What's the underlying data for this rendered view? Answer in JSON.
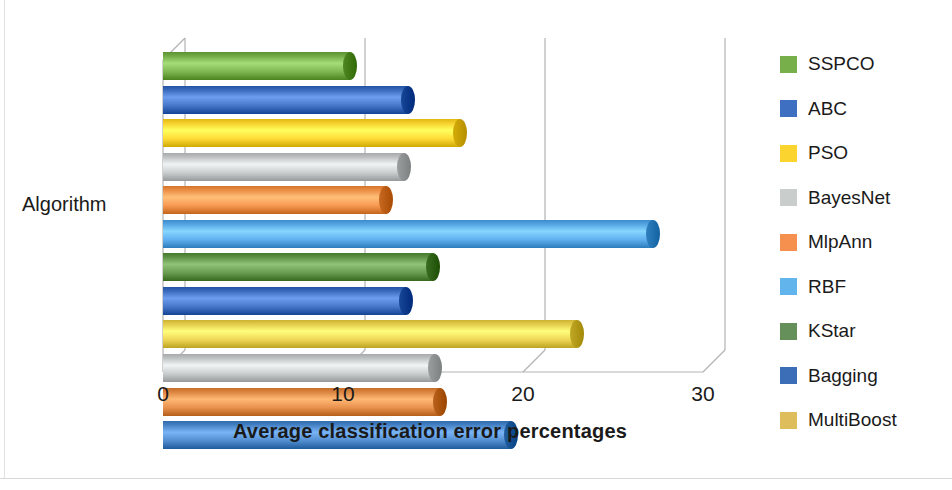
{
  "chart_data": {
    "type": "bar",
    "orientation": "horizontal",
    "title": "",
    "xlabel": "Average classification error percentages",
    "ylabel": "Algorithm",
    "xlim": [
      0,
      30
    ],
    "xticks": [
      0,
      10,
      20,
      30
    ],
    "xtick_labels": [
      "0",
      "10",
      "20",
      "30"
    ],
    "ytick_labels": [
      "Algorithm"
    ],
    "grid": true,
    "legend_position": "right",
    "style": "3d-cylinder",
    "categories": [
      "SSPCO",
      "ABC",
      "PSO",
      "BayesNet",
      "MlpAnn",
      "RBF",
      "KStar",
      "Bagging",
      "MultiBoost"
    ],
    "values": [
      10.8,
      14.0,
      16.9,
      13.8,
      12.8,
      27.6,
      15.4,
      13.9,
      23.4
    ],
    "series": [
      {
        "name": "Average classification error percentages",
        "points": [
          {
            "label": "SSPCO",
            "value": 10.8,
            "color": "#77b04a"
          },
          {
            "label": "ABC",
            "value": 14.0,
            "color": "#3f6fc0"
          },
          {
            "label": "PSO",
            "value": 16.9,
            "color": "#fcd430"
          },
          {
            "label": "BayesNet",
            "value": 13.8,
            "color": "#c3c6c7"
          },
          {
            "label": "MlpAnn",
            "value": 12.8,
            "color": "#f0914a"
          },
          {
            "label": "RBF",
            "value": 27.6,
            "color": "#58a8e8"
          },
          {
            "label": "KStar",
            "value": 15.4,
            "color": "#62954a"
          },
          {
            "label": "Bagging",
            "value": 13.9,
            "color": "#3f6fc0"
          },
          {
            "label": "MultiBoost",
            "value": 23.4,
            "color": "#e8cf4e"
          }
        ]
      }
    ],
    "extra_rows_below": [
      {
        "label": "BayesNet",
        "value": 15.5,
        "color": "#c3c6c7"
      },
      {
        "label": "MlpAnn",
        "value": 15.8,
        "color": "#e08a46"
      },
      {
        "label": "Bagging",
        "value": 19.7,
        "color": "#4a86c8"
      }
    ]
  },
  "axis": {
    "x_title": "Average classification error percentages",
    "y_title": "Algorithm",
    "tick_0": "0",
    "tick_1": "10",
    "tick_2": "20",
    "tick_3": "30"
  },
  "legend": {
    "items": [
      {
        "label": "SSPCO",
        "color": "#77b04a"
      },
      {
        "label": "ABC",
        "color": "#3f6fc0"
      },
      {
        "label": "PSO",
        "color": "#fcd430"
      },
      {
        "label": "BayesNet",
        "color": "#c9cdcb"
      },
      {
        "label": "MlpAnn",
        "color": "#f5904f"
      },
      {
        "label": "RBF",
        "color": "#62b4ec"
      },
      {
        "label": "KStar",
        "color": "#66905a"
      },
      {
        "label": "Bagging",
        "color": "#3c6eb8"
      },
      {
        "label": "MultiBoost",
        "color": "#ddbd5c"
      }
    ]
  }
}
